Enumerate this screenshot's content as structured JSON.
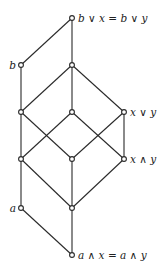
{
  "diagram": {
    "type": "hasse-diagram",
    "nodes": [
      {
        "id": "top",
        "x": 72,
        "y": 18,
        "label": "b ∨ x = b ∨ y",
        "label_side": "right"
      },
      {
        "id": "b",
        "x": 21,
        "y": 65,
        "label": "b",
        "label_side": "left"
      },
      {
        "id": "m1",
        "x": 72,
        "y": 65,
        "label": ""
      },
      {
        "id": "l3",
        "x": 21,
        "y": 112,
        "label": ""
      },
      {
        "id": "c3",
        "x": 72,
        "y": 112,
        "label": ""
      },
      {
        "id": "xvy",
        "x": 124,
        "y": 112,
        "label": "x ∨ y",
        "label_side": "right"
      },
      {
        "id": "l4",
        "x": 21,
        "y": 159,
        "label": ""
      },
      {
        "id": "c4",
        "x": 72,
        "y": 159,
        "label": ""
      },
      {
        "id": "xay",
        "x": 124,
        "y": 159,
        "label": "x ∧ y",
        "label_side": "right"
      },
      {
        "id": "a",
        "x": 21,
        "y": 208,
        "label": "a",
        "label_side": "left"
      },
      {
        "id": "c5",
        "x": 72,
        "y": 208,
        "label": ""
      },
      {
        "id": "bottom",
        "x": 72,
        "y": 255,
        "label": "a ∧ x = a ∧ y",
        "label_side": "right"
      }
    ],
    "edges": [
      [
        "top",
        "b"
      ],
      [
        "top",
        "m1"
      ],
      [
        "b",
        "l3"
      ],
      [
        "m1",
        "l3"
      ],
      [
        "m1",
        "c3"
      ],
      [
        "m1",
        "xvy"
      ],
      [
        "l3",
        "l4"
      ],
      [
        "l3",
        "c4"
      ],
      [
        "c3",
        "l4"
      ],
      [
        "c3",
        "xay"
      ],
      [
        "xvy",
        "c4"
      ],
      [
        "xvy",
        "xay"
      ],
      [
        "l4",
        "a"
      ],
      [
        "l4",
        "c5"
      ],
      [
        "c4",
        "c5"
      ],
      [
        "xay",
        "c5"
      ],
      [
        "a",
        "bottom"
      ],
      [
        "c5",
        "bottom"
      ]
    ]
  },
  "labels": {
    "top": "b ∨ x = b ∨ y",
    "b": "b",
    "xvy": "x ∨ y",
    "xay": "x ∧ y",
    "a": "a",
    "bottom": "a ∧ x = a ∧ y"
  }
}
